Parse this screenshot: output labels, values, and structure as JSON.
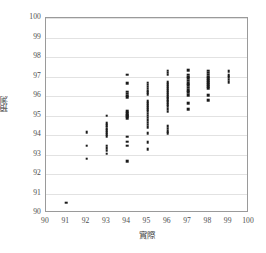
{
  "chart_data": {
    "type": "scatter",
    "title": "",
    "xlabel": "實際",
    "ylabel": "預測",
    "xlim": [
      90,
      100
    ],
    "ylim": [
      90,
      100
    ],
    "grid": true,
    "grid_axis": "y",
    "legend": false,
    "marker_color": "#1a1a1a",
    "frame_color": "#9a9a9a",
    "gridline_color": "#e2e2e2",
    "xticks": [
      90,
      91,
      92,
      93,
      94,
      95,
      96,
      97,
      98,
      99,
      100
    ],
    "yticks": [
      90,
      91,
      92,
      93,
      94,
      95,
      96,
      97,
      98,
      99,
      100
    ],
    "xtick_labels": [
      "90",
      "91",
      "92",
      "93",
      "94",
      "95",
      "96",
      "97",
      "98",
      "99",
      "100"
    ],
    "ytick_labels": [
      "100",
      "99",
      "98",
      "97",
      "96",
      "95",
      "94",
      "93",
      "92",
      "91",
      "90"
    ],
    "points": [
      [
        91.0,
        90.52
      ],
      [
        92.0,
        94.15
      ],
      [
        92.0,
        93.45
      ],
      [
        92.0,
        92.78
      ],
      [
        93.0,
        95.0
      ],
      [
        93.0,
        94.62
      ],
      [
        93.0,
        94.5
      ],
      [
        93.0,
        94.42
      ],
      [
        93.0,
        94.33
      ],
      [
        93.0,
        94.25
      ],
      [
        93.0,
        94.15
      ],
      [
        93.0,
        94.05
      ],
      [
        93.0,
        93.95
      ],
      [
        93.0,
        93.45
      ],
      [
        93.0,
        93.32
      ],
      [
        93.0,
        93.2
      ],
      [
        93.0,
        93.05
      ],
      [
        94.0,
        97.1
      ],
      [
        94.0,
        96.65
      ],
      [
        94.0,
        96.22
      ],
      [
        94.0,
        96.12
      ],
      [
        94.0,
        96.02
      ],
      [
        94.0,
        95.95
      ],
      [
        94.0,
        95.22
      ],
      [
        94.0,
        95.12
      ],
      [
        94.0,
        95.02
      ],
      [
        94.0,
        94.95
      ],
      [
        94.0,
        94.85
      ],
      [
        94.0,
        93.92
      ],
      [
        94.0,
        93.65
      ],
      [
        94.0,
        93.45
      ],
      [
        94.0,
        92.65
      ],
      [
        95.0,
        96.68
      ],
      [
        95.0,
        96.58
      ],
      [
        95.0,
        96.48
      ],
      [
        95.0,
        96.38
      ],
      [
        95.0,
        96.28
      ],
      [
        95.0,
        96.18
      ],
      [
        95.0,
        96.08
      ],
      [
        95.0,
        95.72
      ],
      [
        95.0,
        95.62
      ],
      [
        95.0,
        95.52
      ],
      [
        95.0,
        95.42
      ],
      [
        95.0,
        95.32
      ],
      [
        95.0,
        95.22
      ],
      [
        95.0,
        95.1
      ],
      [
        95.0,
        95.0
      ],
      [
        95.0,
        94.88
      ],
      [
        95.0,
        94.76
      ],
      [
        95.0,
        94.64
      ],
      [
        95.0,
        94.52
      ],
      [
        95.0,
        94.4
      ],
      [
        95.0,
        94.1
      ],
      [
        95.0,
        93.62
      ],
      [
        95.0,
        93.28
      ],
      [
        96.0,
        97.3
      ],
      [
        96.0,
        97.2
      ],
      [
        96.0,
        97.1
      ],
      [
        96.0,
        96.7
      ],
      [
        96.0,
        96.6
      ],
      [
        96.0,
        96.5
      ],
      [
        96.0,
        96.4
      ],
      [
        96.0,
        96.3
      ],
      [
        96.0,
        96.2
      ],
      [
        96.0,
        96.1
      ],
      [
        96.0,
        96.0
      ],
      [
        96.0,
        95.92
      ],
      [
        96.0,
        95.84
      ],
      [
        96.0,
        95.76
      ],
      [
        96.0,
        95.68
      ],
      [
        96.0,
        95.58
      ],
      [
        96.0,
        95.48
      ],
      [
        96.0,
        95.32
      ],
      [
        96.0,
        95.2
      ],
      [
        96.0,
        94.45
      ],
      [
        96.0,
        94.32
      ],
      [
        96.0,
        94.2
      ],
      [
        96.0,
        94.08
      ],
      [
        97.0,
        97.32
      ],
      [
        97.0,
        97.1
      ],
      [
        97.0,
        97.0
      ],
      [
        97.0,
        96.9
      ],
      [
        97.0,
        96.78
      ],
      [
        97.0,
        96.66
      ],
      [
        97.0,
        96.54
      ],
      [
        97.0,
        96.42
      ],
      [
        97.0,
        96.3
      ],
      [
        97.0,
        96.18
      ],
      [
        97.0,
        96.05
      ],
      [
        97.0,
        95.62
      ],
      [
        97.0,
        95.32
      ],
      [
        98.0,
        97.3
      ],
      [
        98.0,
        97.2
      ],
      [
        98.0,
        97.1
      ],
      [
        98.0,
        97.0
      ],
      [
        98.0,
        96.9
      ],
      [
        98.0,
        96.8
      ],
      [
        98.0,
        96.7
      ],
      [
        98.0,
        96.6
      ],
      [
        98.0,
        96.5
      ],
      [
        98.0,
        96.4
      ],
      [
        98.0,
        96.05
      ],
      [
        98.0,
        95.78
      ],
      [
        99.0,
        97.28
      ],
      [
        99.0,
        97.08
      ],
      [
        99.0,
        96.96
      ],
      [
        99.0,
        96.84
      ],
      [
        99.0,
        96.72
      ]
    ]
  }
}
